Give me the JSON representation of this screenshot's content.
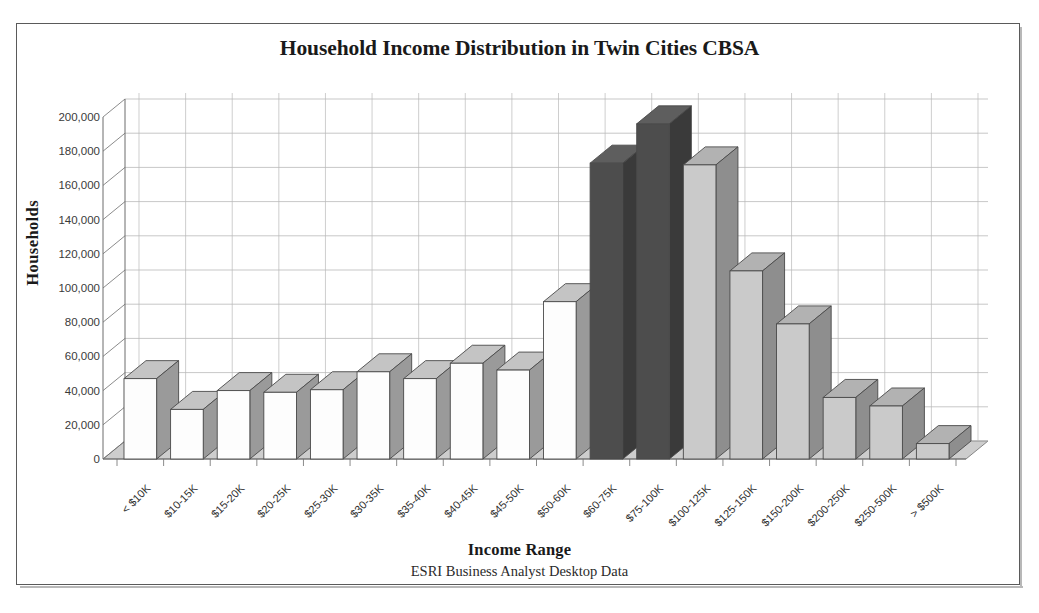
{
  "figure": {
    "title": "Household Income Distribution in Twin Cities CBSA",
    "x_axis_title": "Income Range",
    "x_axis_subtitle": "ESRI Business Analyst Desktop Data",
    "y_axis_title": "Households"
  },
  "colors": {
    "bar_white_face": "#fdfdfd",
    "bar_white_side": "#9a9a9a",
    "bar_white_top": "#c4c4c4",
    "bar_dark_face": "#4d4d4d",
    "bar_dark_side": "#3a3a3a",
    "bar_dark_top": "#5e5e5e",
    "bar_gray_face": "#cacaca",
    "bar_gray_side": "#8e8e8e",
    "bar_gray_top": "#b2b2b2",
    "grid": "#b9b9b9",
    "axis": "#6d6d6d",
    "floor": "#cdcdcd",
    "frame": "#5a5a5a",
    "text": "#1a1a1a"
  },
  "chart_data": {
    "type": "bar",
    "title": "Household Income Distribution in Twin Cities CBSA",
    "subtitle": "ESRI Business Analyst Desktop Data",
    "xlabel": "Income Range",
    "ylabel": "Households",
    "ylim": [
      0,
      200000
    ],
    "ytick_step": 20000,
    "ytick_labels": [
      "0",
      "20,000",
      "40,000",
      "60,000",
      "80,000",
      "100,000",
      "120,000",
      "140,000",
      "160,000",
      "180,000",
      "200,000"
    ],
    "ytick_values": [
      0,
      20000,
      40000,
      60000,
      80000,
      100000,
      120000,
      140000,
      160000,
      180000,
      200000
    ],
    "grid": true,
    "legend": false,
    "three_d": true,
    "categories": [
      "< $10K",
      "$10-15K",
      "$15-20K",
      "$20-25K",
      "$25-30K",
      "$30-35K",
      "$35-40K",
      "$40-45K",
      "$45-50K",
      "$50-60K",
      "$60-75K",
      "$75-100K",
      "$100-125K",
      "$125-150K",
      "$150-200K",
      "$200-250K",
      "$250-500K",
      "> $500K"
    ],
    "values": [
      47000,
      29000,
      40000,
      39000,
      40500,
      51000,
      47000,
      56000,
      52000,
      92000,
      173000,
      196000,
      172000,
      110000,
      79000,
      36000,
      31000,
      9000
    ],
    "bar_styles": [
      "white",
      "white",
      "white",
      "white",
      "white",
      "white",
      "white",
      "white",
      "white",
      "white",
      "dark",
      "dark",
      "gray",
      "gray",
      "gray",
      "gray",
      "gray",
      "gray"
    ]
  }
}
